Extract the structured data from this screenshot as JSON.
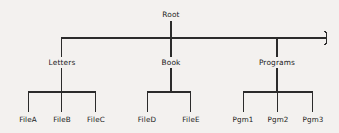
{
  "diagram": {
    "background_color": "#f3f1ef",
    "line_color": "#2b2b2b",
    "text_color": "#1a1a1a",
    "continuation_marker": "break-squiggle",
    "root": {
      "label": "Root",
      "x": 171,
      "y": 15
    },
    "level1": [
      {
        "label": "Letters",
        "x": 62,
        "y": 63
      },
      {
        "label": "Book",
        "x": 171,
        "y": 63
      },
      {
        "label": "Programs",
        "x": 277,
        "y": 63
      }
    ],
    "leaves": [
      {
        "label": "FileA",
        "x": 28,
        "y": 120,
        "parent": "Letters"
      },
      {
        "label": "FileB",
        "x": 62,
        "y": 120,
        "parent": "Letters"
      },
      {
        "label": "FileC",
        "x": 96,
        "y": 120,
        "parent": "Letters"
      },
      {
        "label": "FileD",
        "x": 147,
        "y": 120,
        "parent": "Book"
      },
      {
        "label": "FileE",
        "x": 191,
        "y": 120,
        "parent": "Book"
      },
      {
        "label": "Pgm1",
        "x": 243,
        "y": 120,
        "parent": "Programs"
      },
      {
        "label": "Pgm2",
        "x": 278,
        "y": 120,
        "parent": "Programs"
      },
      {
        "label": "Pgm3",
        "x": 313,
        "y": 120,
        "parent": "Programs"
      }
    ],
    "bus": {
      "y": 38,
      "x_start": 61,
      "x_end": 325
    },
    "child_bars": [
      {
        "parent": "Letters",
        "y": 92,
        "x_start": 28,
        "x_end": 96
      },
      {
        "parent": "Book",
        "y": 92,
        "x_start": 147,
        "x_end": 191
      },
      {
        "parent": "Programs",
        "y": 92,
        "x_start": 243,
        "x_end": 313
      }
    ]
  }
}
